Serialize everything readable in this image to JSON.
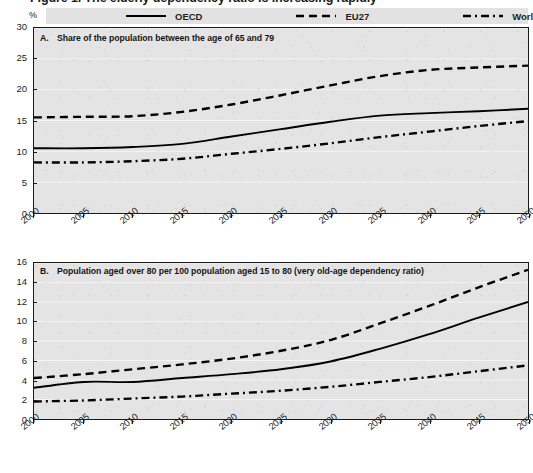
{
  "figure": {
    "title": "Figure 1. The elderly dependency ratio is increasing rapidly",
    "unit_label": "%"
  },
  "legend": {
    "position": "top",
    "items": [
      {
        "label": "OECD",
        "style": "solid",
        "color": "#000000",
        "key": "line-solid-icon"
      },
      {
        "label": "EU27",
        "style": "dashed",
        "color": "#000000",
        "key": "line-dashed-icon"
      },
      {
        "label": "World",
        "style": "dashdot",
        "color": "#000000",
        "key": "line-dashdot-icon"
      }
    ]
  },
  "panels": [
    {
      "id": "A",
      "letter": "A.",
      "caption": "Share of the population between the age of 65 and 79"
    },
    {
      "id": "B",
      "letter": "B.",
      "caption": "Population aged over 80 per 100 population aged 15 to 80 (very old-age dependency ratio)"
    }
  ],
  "chart_data": [
    {
      "type": "line",
      "panel": "A",
      "title": "A. Share of the population between the age of 65 and 79",
      "xlabel": "",
      "ylabel": "%",
      "x": [
        2000,
        2005,
        2010,
        2015,
        2020,
        2025,
        2030,
        2035,
        2040,
        2045,
        2050
      ],
      "xlim": [
        2000,
        2050
      ],
      "ylim": [
        0,
        30
      ],
      "yticks": [
        0,
        5,
        10,
        15,
        20,
        25,
        30
      ],
      "xticks": [
        2000,
        2005,
        2010,
        2015,
        2020,
        2025,
        2030,
        2035,
        2040,
        2045,
        2050
      ],
      "grid": true,
      "legend_position": "top",
      "series": [
        {
          "name": "OECD",
          "style": "solid",
          "values": [
            10.5,
            10.5,
            10.7,
            11.2,
            12.4,
            13.6,
            14.8,
            15.8,
            16.2,
            16.5,
            16.9
          ]
        },
        {
          "name": "EU27",
          "style": "dashed",
          "values": [
            15.5,
            15.6,
            15.7,
            16.4,
            17.6,
            19.1,
            20.7,
            22.2,
            23.2,
            23.6,
            23.9
          ]
        },
        {
          "name": "World",
          "style": "dashdot",
          "values": [
            8.2,
            8.2,
            8.4,
            8.8,
            9.6,
            10.4,
            11.3,
            12.3,
            13.2,
            14.1,
            14.9
          ]
        }
      ]
    },
    {
      "type": "line",
      "panel": "B",
      "title": "B. Population aged over 80 per 100 population aged 15 to 80 (very old-age dependency ratio)",
      "xlabel": "",
      "ylabel": "%",
      "x": [
        2000,
        2005,
        2010,
        2015,
        2020,
        2025,
        2030,
        2035,
        2040,
        2045,
        2050
      ],
      "xlim": [
        2000,
        2050
      ],
      "ylim": [
        0,
        16
      ],
      "yticks": [
        0,
        2,
        4,
        6,
        8,
        10,
        12,
        14,
        16
      ],
      "xticks": [
        2000,
        2005,
        2010,
        2015,
        2020,
        2025,
        2030,
        2035,
        2040,
        2045,
        2050
      ],
      "grid": true,
      "legend_position": "top",
      "series": [
        {
          "name": "OECD",
          "style": "solid",
          "values": [
            3.2,
            3.8,
            3.8,
            4.2,
            4.6,
            5.1,
            5.9,
            7.2,
            8.7,
            10.4,
            12.0
          ]
        },
        {
          "name": "EU27",
          "style": "dashed",
          "values": [
            4.2,
            4.6,
            5.1,
            5.6,
            6.2,
            7.0,
            8.1,
            9.8,
            11.6,
            13.5,
            15.3
          ]
        },
        {
          "name": "World",
          "style": "dashdot",
          "values": [
            1.8,
            1.9,
            2.1,
            2.3,
            2.6,
            2.9,
            3.3,
            3.8,
            4.3,
            4.9,
            5.5
          ]
        }
      ]
    }
  ],
  "colors": {
    "plot_background": "#e4e4e4",
    "axis": "#1a1a1a",
    "gridline": "#f2f2f2",
    "series": "#000000"
  }
}
